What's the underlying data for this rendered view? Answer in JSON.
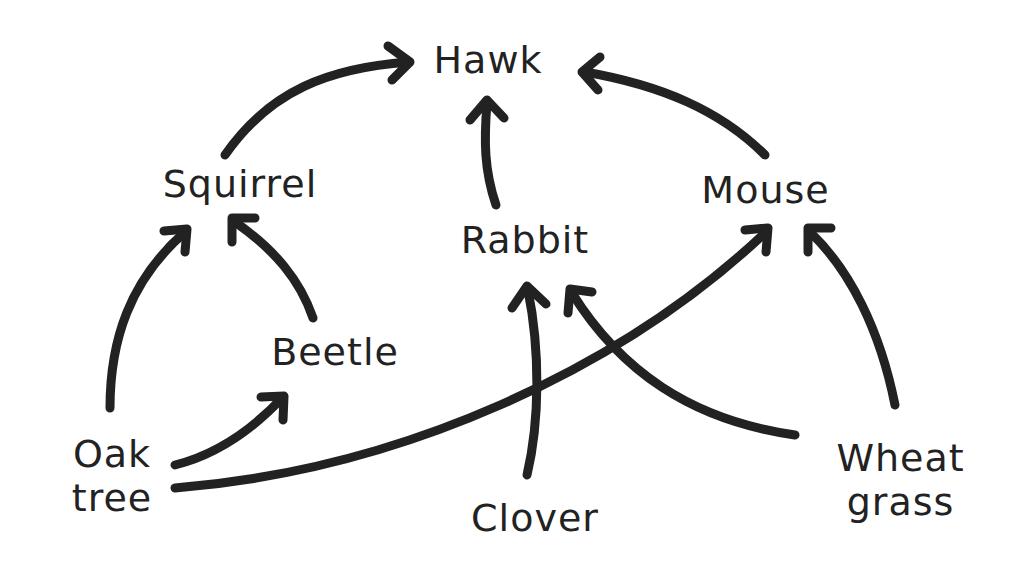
{
  "diagram": {
    "type": "food-web",
    "colors": {
      "background": "#ffffff",
      "ink": "#222222"
    },
    "nodes": {
      "hawk": {
        "label": "Hawk"
      },
      "squirrel": {
        "label": "Squirrel"
      },
      "rabbit": {
        "label": "Rabbit"
      },
      "mouse": {
        "label": "Mouse"
      },
      "beetle": {
        "label": "Beetle"
      },
      "oak_tree": {
        "line1": "Oak",
        "line2": "tree"
      },
      "clover": {
        "label": "Clover"
      },
      "wheat_grass": {
        "line1": "Wheat",
        "line2": "grass"
      }
    },
    "edges": [
      {
        "from": "Squirrel",
        "to": "Hawk"
      },
      {
        "from": "Rabbit",
        "to": "Hawk"
      },
      {
        "from": "Mouse",
        "to": "Hawk"
      },
      {
        "from": "Oak tree",
        "to": "Squirrel"
      },
      {
        "from": "Beetle",
        "to": "Squirrel"
      },
      {
        "from": "Oak tree",
        "to": "Beetle"
      },
      {
        "from": "Oak tree",
        "to": "Mouse"
      },
      {
        "from": "Clover",
        "to": "Rabbit"
      },
      {
        "from": "Wheat grass",
        "to": "Rabbit"
      },
      {
        "from": "Wheat grass",
        "to": "Mouse"
      }
    ]
  }
}
